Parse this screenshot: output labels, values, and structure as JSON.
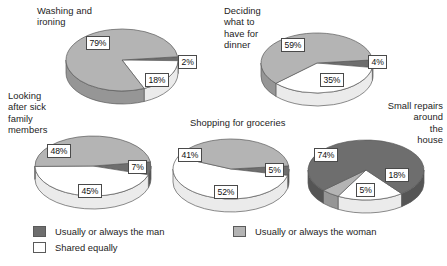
{
  "chart_data": {
    "type": "pie",
    "title": "",
    "legend_position": "bottom",
    "palette": {
      "man": "#6e6e6e",
      "woman": "#b4b4b4",
      "shared": "#ffffff",
      "man_side": "#555555",
      "woman_side": "#969696",
      "shared_side": "#ebebeb",
      "outline": "#5a5a5a"
    },
    "categories": [
      "Usually or always the man",
      "Usually or always the woman",
      "Shared equally"
    ],
    "charts": [
      {
        "name": "washing-and-ironing",
        "title": "Washing and\nironing",
        "title_align": "left",
        "values": {
          "man": 2,
          "woman": 79,
          "shared": 18
        },
        "labels": {
          "man": "2%",
          "woman": "79%",
          "shared": "18%"
        }
      },
      {
        "name": "deciding-what-to-have-for-dinner",
        "title": "Deciding\nwhat to\nhave for\ndinner",
        "title_align": "left",
        "values": {
          "man": 4,
          "woman": 59,
          "shared": 35
        },
        "labels": {
          "man": "4%",
          "woman": "59%",
          "shared": "35%"
        }
      },
      {
        "name": "looking-after-sick-family-members",
        "title": "Looking\nafter sick\nfamily\nmembers",
        "title_align": "left",
        "values": {
          "man": 7,
          "woman": 48,
          "shared": 45
        },
        "labels": {
          "man": "7%",
          "woman": "48%",
          "shared": "45%"
        }
      },
      {
        "name": "shopping-for-groceries",
        "title": "Shopping for groceries",
        "title_align": "left",
        "values": {
          "man": 5,
          "woman": 41,
          "shared": 52
        },
        "labels": {
          "man": "5%",
          "woman": "41%",
          "shared": "52%"
        }
      },
      {
        "name": "small-repairs-around-the-house",
        "title": "Small repairs\naround\nthe\nhouse",
        "title_align": "right",
        "values": {
          "man": 74,
          "woman": 5,
          "shared": 18
        },
        "labels": {
          "man": "74%",
          "woman": "5%",
          "shared": "18%"
        }
      }
    ],
    "legend": [
      {
        "key": "man",
        "label": "Usually or always the man",
        "color": "#6e6e6e"
      },
      {
        "key": "woman",
        "label": "Usually or always the woman",
        "color": "#b4b4b4"
      },
      {
        "key": "shared",
        "label": "Shared equally",
        "color": "#ffffff"
      }
    ]
  }
}
